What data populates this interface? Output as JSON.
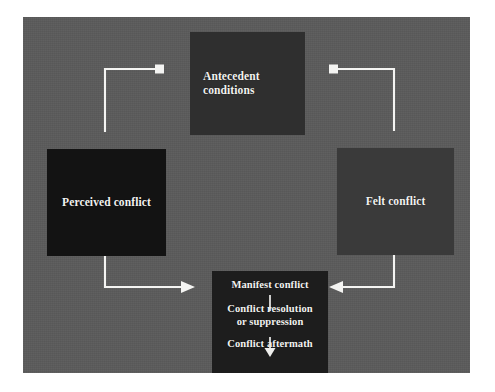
{
  "diagram": {
    "panel_color": "#5b5b5b",
    "line_color": "#f4f4f2",
    "text_color": "#f2f2f0",
    "nodes": {
      "antecedent": {
        "label": "Antecedent\nconditions",
        "line1": "Antecedent",
        "line2": "conditions",
        "fill": "#2f2f2f"
      },
      "perceived": {
        "label": "Perceived conflict",
        "fill": "#131313"
      },
      "felt": {
        "label": "Felt conflict",
        "fill": "#3a3a3a"
      },
      "manifest": {
        "fill": "#1d1d1d",
        "stage1": "Manifest conflict",
        "stage2_line1": "Conflict resolution",
        "stage2_line2": "or suppression",
        "stage3": "Conflict aftermath"
      }
    },
    "connectors": [
      {
        "name": "antecedent-to-perceived",
        "from": "antecedent",
        "to": "perceived",
        "marker_start": "square",
        "marker_end": "none"
      },
      {
        "name": "antecedent-to-felt",
        "from": "antecedent",
        "to": "felt",
        "marker_start": "square",
        "marker_end": "none"
      },
      {
        "name": "perceived-to-manifest",
        "from": "perceived",
        "to": "manifest",
        "marker_start": "none",
        "marker_end": "arrow-right"
      },
      {
        "name": "felt-to-manifest",
        "from": "felt",
        "to": "manifest",
        "marker_start": "none",
        "marker_end": "arrow-left"
      },
      {
        "name": "manifest-stage1-to-stage2",
        "from": "manifest-stage1",
        "to": "manifest-stage2",
        "marker_start": "none",
        "marker_end": "none"
      },
      {
        "name": "manifest-stage2-to-stage3",
        "from": "manifest-stage2",
        "to": "manifest-stage3",
        "marker_start": "none",
        "marker_end": "arrow-down"
      }
    ]
  }
}
